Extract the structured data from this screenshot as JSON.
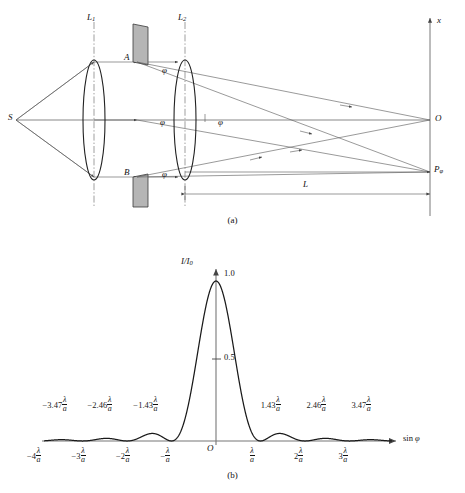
{
  "figure": {
    "panel_a_caption": "(a)",
    "panel_b_caption": "(b)",
    "optics": {
      "source_label": "S",
      "lens1_label": "L",
      "lens1_sub": "1",
      "lens2_label": "L",
      "lens2_sub": "2",
      "slit_top_label": "A",
      "slit_bottom_label": "B",
      "angle_labels": [
        "φ",
        "φ",
        "φ",
        "φ"
      ],
      "screen_axis_label": "x",
      "center_point_label": "O",
      "field_point_label": "P",
      "field_point_sub": "φ",
      "distance_label": "L"
    }
  },
  "chart_data": {
    "type": "line",
    "title": "",
    "subtitle": "",
    "xlabel": "sin φ",
    "ylabel": "I/I",
    "ylabel_sub": "0",
    "origin_label": "O",
    "ylim": [
      0,
      1.08
    ],
    "xlim": [
      -4.6,
      4.6
    ],
    "grid": false,
    "legend": "none",
    "y_value_labels": [
      {
        "value": 1.0,
        "text": "1.0"
      },
      {
        "value": 0.5,
        "text": "0.5"
      }
    ],
    "x_zero_ticks": [
      {
        "value": -4,
        "coef": "−4",
        "num": "λ",
        "den": "a"
      },
      {
        "value": -3,
        "coef": "−3",
        "num": "λ",
        "den": "a"
      },
      {
        "value": -2,
        "coef": "−2",
        "num": "λ",
        "den": "a"
      },
      {
        "value": -1,
        "coef": "−",
        "num": "λ",
        "den": "a"
      },
      {
        "value": 1,
        "coef": "",
        "num": "λ",
        "den": "a"
      },
      {
        "value": 2,
        "coef": "2",
        "num": "λ",
        "den": "a"
      },
      {
        "value": 3,
        "coef": "3",
        "num": "λ",
        "den": "a"
      }
    ],
    "secondary_maxima_labels": [
      {
        "value": -3.47,
        "coef": "−3.47",
        "num": "λ",
        "den": "a"
      },
      {
        "value": -2.46,
        "coef": "−2.46",
        "num": "λ",
        "den": "a"
      },
      {
        "value": -1.43,
        "coef": "−1.43",
        "num": "λ",
        "den": "a"
      },
      {
        "value": 1.43,
        "coef": "1.43",
        "num": "λ",
        "den": "a"
      },
      {
        "value": 2.46,
        "coef": "2.46",
        "num": "λ",
        "den": "a"
      },
      {
        "value": 3.47,
        "coef": "3.47",
        "num": "λ",
        "den": "a"
      }
    ],
    "secondary_maxima_values": [
      {
        "x": -3.47,
        "y": 0.0083
      },
      {
        "x": -2.46,
        "y": 0.0165
      },
      {
        "x": -1.43,
        "y": 0.0472
      },
      {
        "x": 1.43,
        "y": 0.0472
      },
      {
        "x": 2.46,
        "y": 0.0165
      },
      {
        "x": 3.47,
        "y": 0.0083
      }
    ],
    "central_max": {
      "x": 0,
      "y": 1.0
    },
    "zeros": [
      -4,
      -3,
      -2,
      -1,
      1,
      2,
      3,
      4
    ],
    "function": "(sin(pi*x)/(pi*x))^2"
  },
  "colors": {
    "ink": "#1a1a1a",
    "line": "#333333",
    "axis": "#666666",
    "barrier_fill": "#b5b5b5",
    "barrier_stroke": "#3a3a3a"
  }
}
